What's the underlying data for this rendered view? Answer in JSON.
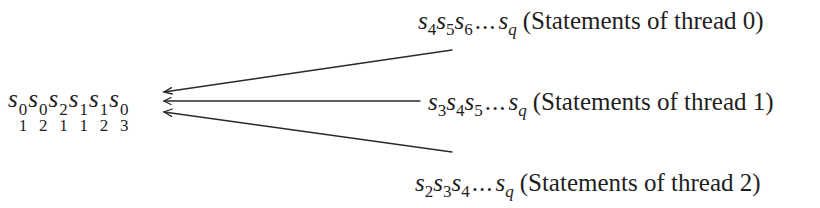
{
  "diagram": {
    "type": "merge-diagram",
    "stroke_color": "#2a2a2a",
    "text_color": "#1e1e1e",
    "merged_sequence": {
      "label": "Interleaved statement sequence",
      "terms": [
        {
          "base": "s",
          "sub": "1",
          "sup": "0"
        },
        {
          "base": "s",
          "sub": "2",
          "sup": "0"
        },
        {
          "base": "s",
          "sub": "1",
          "sup": "2"
        },
        {
          "base": "s",
          "sub": "1",
          "sup": "1"
        },
        {
          "base": "s",
          "sub": "2",
          "sup": "1"
        },
        {
          "base": "s",
          "sub": "3",
          "sup": "0"
        }
      ]
    },
    "threads": [
      {
        "id": "thread-0",
        "terms": [
          {
            "base": "s",
            "sub": "4"
          },
          {
            "base": "s",
            "sub": "5"
          },
          {
            "base": "s",
            "sub": "6"
          }
        ],
        "ellipsis": "...",
        "last": {
          "base": "s",
          "sub": "q"
        },
        "caption": "(Statements of thread 0)",
        "arrow": {
          "from": [
            452,
            50
          ],
          "to": [
            163,
            92
          ]
        }
      },
      {
        "id": "thread-1",
        "terms": [
          {
            "base": "s",
            "sub": "3"
          },
          {
            "base": "s",
            "sub": "4"
          },
          {
            "base": "s",
            "sub": "5"
          }
        ],
        "ellipsis": "...",
        "last": {
          "base": "s",
          "sub": "q"
        },
        "caption": "(Statements of thread 1)",
        "arrow": {
          "from": [
            420,
            101
          ],
          "to": [
            163,
            101
          ]
        }
      },
      {
        "id": "thread-2",
        "terms": [
          {
            "base": "s",
            "sub": "2"
          },
          {
            "base": "s",
            "sub": "3"
          },
          {
            "base": "s",
            "sub": "4"
          }
        ],
        "ellipsis": "...",
        "last": {
          "base": "s",
          "sub": "q"
        },
        "caption": "(Statements of thread 2)",
        "arrow": {
          "from": [
            452,
            152
          ],
          "to": [
            163,
            112
          ]
        }
      }
    ]
  }
}
